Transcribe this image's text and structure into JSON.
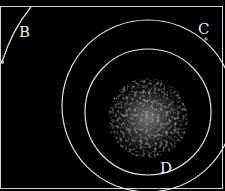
{
  "figure": {
    "background": "#000000",
    "line_color": "#e0e0e0",
    "labels": {
      "b": "B",
      "c": "C",
      "d": "D"
    },
    "elements": {
      "outer_circle": "Outer circle",
      "inner_circle": "Inner circle",
      "arc_b": "Arc B",
      "central_cloud": "Central speckle cloud"
    }
  }
}
